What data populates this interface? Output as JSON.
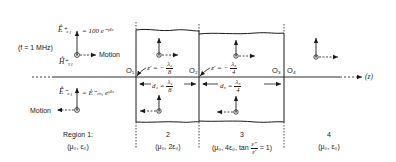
{
  "figure": {
    "axis_label": "(z)",
    "frequency_label": "(f = 1 MHz)",
    "motion_label": "Motion",
    "incident": {
      "e_field": "Ê⁺ₓ₁ = 100 e^(−γ₁z)",
      "e_symbol": "Ê⁺ₓ₁",
      "e_expr": "= 100 e⁻ᵞ¹ᶻ",
      "h_symbol": "Ĥ⁺ᵧ₁",
      "motion_direction": "+z"
    },
    "reflected": {
      "e_symbol": "Ê⁻ₓ₁",
      "e_expr": "= Ê⁻ₘ₁ eᵞ¹ᶻ",
      "motion_direction": "-z"
    },
    "origins": [
      "O₁",
      "O₂",
      "O₃",
      "O₄"
    ],
    "reference_points": [
      {
        "label": "z' = −",
        "num": "λ₂",
        "den": "8"
      },
      {
        "label": "z' = −",
        "num": "λ₃",
        "den": "4"
      }
    ],
    "thicknesses": [
      {
        "label": "d₂ =",
        "num": "λ₂",
        "den": "8"
      },
      {
        "label": "d₃ =",
        "num": "λ₃",
        "den": "4"
      }
    ],
    "regions": [
      {
        "name": "Region 1:",
        "params": "(μ₀, ε₀)"
      },
      {
        "name": "2",
        "params": "(μ₀, 2ε₀)"
      },
      {
        "name": "3",
        "params_prefix": "(μ₀, 4ε₀, tan",
        "loss_num": "ε″",
        "loss_den": "ε′",
        "params_suffix": "= 1)"
      },
      {
        "name": "4",
        "params": "(μ₀, ε₀)"
      }
    ],
    "colors": {
      "ink": "#1a1a1a",
      "background": "#ffffff"
    }
  }
}
